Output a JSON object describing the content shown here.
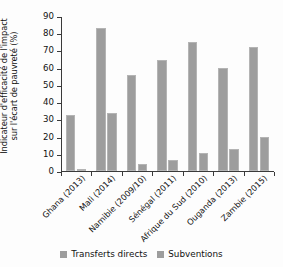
{
  "chart_data": {
    "type": "bar",
    "title": "",
    "xlabel": "",
    "ylabel": "Indicateur d'efficacité de l'impact sur l'écart de pauvreté (%)",
    "ylabel_line1": "Indicateur d'efficacité de l'impact",
    "ylabel_line2": "sur l'écart de pauvreté (%)",
    "ylim": [
      0,
      90
    ],
    "yticks": [
      0,
      10,
      20,
      30,
      40,
      50,
      60,
      70,
      80,
      90
    ],
    "ytick_labels": [
      "0",
      "10",
      "20",
      "30",
      "40",
      "50",
      "60",
      "70",
      "80",
      "90"
    ],
    "grid": false,
    "legend_position": "bottom",
    "categories": [
      "Ghana (2013)",
      "Mali (2014)",
      "Namibie (2009/10)",
      "Sénégal (2011)",
      "Afrique du Sud (2010)",
      "Ouganda (2013)",
      "Zambie (2015)"
    ],
    "series": [
      {
        "name": "Transferts directs",
        "color": "#9d9d9d",
        "values": [
          32.3,
          83.2,
          55.6,
          64.4,
          75.1,
          59.8,
          71.8
        ]
      },
      {
        "name": "Subventions",
        "color": "#9d9d9d",
        "values": [
          1.0,
          33.5,
          4.0,
          6.2,
          10.3,
          12.8,
          20.0
        ]
      }
    ]
  },
  "legend": {
    "items": [
      {
        "label": "Transferts directs",
        "color": "#9d9d9d"
      },
      {
        "label": "Subventions",
        "color": "#9d9d9d"
      }
    ]
  }
}
